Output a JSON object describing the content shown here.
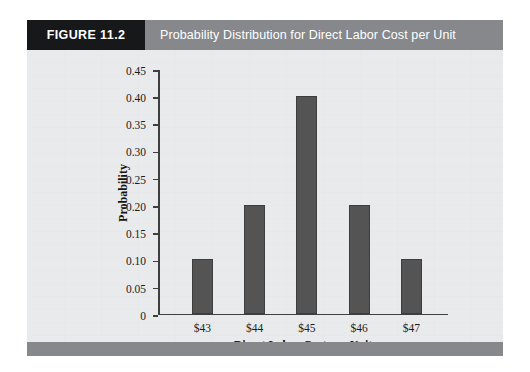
{
  "figure": {
    "number_label": "FIGURE 11.2",
    "title": "Probability Distribution for Direct Labor Cost per Unit"
  },
  "colors": {
    "header_band": "#86888b",
    "number_block": "#17181a",
    "bar_fill": "#545454",
    "panel_background": "#e9eaeb",
    "axis": "#3f3f3f"
  },
  "chart_data": {
    "type": "bar",
    "title": "Probability Distribution for Direct Labor Cost per Unit",
    "xlabel": "Direct Labor Cost per Unit",
    "ylabel": "Probability",
    "categories": [
      "$43",
      "$44",
      "$45",
      "$46",
      "$47"
    ],
    "values": [
      0.1,
      0.2,
      0.4,
      0.2,
      0.1
    ],
    "ylim": [
      0,
      0.45
    ],
    "ytick_labels": [
      "0.45",
      "0.40",
      "0.35",
      "0.30",
      "0.25",
      "0.20",
      "0.15",
      "0.10",
      "0.05",
      "0"
    ],
    "ytick_values": [
      0.45,
      0.4,
      0.35,
      0.3,
      0.25,
      0.2,
      0.15,
      0.1,
      0.05,
      0
    ],
    "grid": false,
    "legend": null
  }
}
